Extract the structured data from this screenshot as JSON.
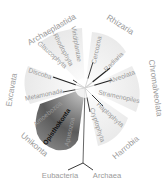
{
  "diagram": {
    "center": [
      85,
      88
    ],
    "supergroups": [
      {
        "id": "archaeplastida",
        "label": "Archaeplastida",
        "x": 52,
        "y": 30,
        "rot": -30
      },
      {
        "id": "rhizaria",
        "label": "Rhizaria",
        "x": 120,
        "y": 25,
        "rot": 32
      },
      {
        "id": "chromalveolata",
        "label": "Chromalveolata",
        "x": 155,
        "y": 88,
        "rot": 82
      },
      {
        "id": "excavata",
        "label": "Excavata",
        "x": 12,
        "y": 90,
        "rot": -80
      },
      {
        "id": "unikonta",
        "label": "Unikonta",
        "x": 34,
        "y": 145,
        "rot": 40
      },
      {
        "id": "harrobia",
        "label": "Harrobia",
        "x": 126,
        "y": 148,
        "rot": -40
      }
    ],
    "groups": [
      {
        "id": "viridiplantae",
        "label": "Viridiplantae",
        "x": 76,
        "y": 44,
        "rot": 80
      },
      {
        "id": "rhodophyta",
        "label": "Rhodophyta",
        "x": 63,
        "y": 50,
        "rot": 62
      },
      {
        "id": "glaucophyta",
        "label": "Glaucophyta",
        "x": 52,
        "y": 55,
        "rot": 42
      },
      {
        "id": "cercozoa",
        "label": "Cercozoa",
        "x": 97,
        "y": 50,
        "rot": -78
      },
      {
        "id": "radiaria",
        "label": "Radiaria",
        "x": 114,
        "y": 62,
        "rot": -45
      },
      {
        "id": "alveolata",
        "label": "Alveolata",
        "x": 122,
        "y": 77,
        "rot": -20
      },
      {
        "id": "stramenopiles",
        "label": "Stramenopiles",
        "x": 119,
        "y": 97,
        "rot": 12
      },
      {
        "id": "haptophyta",
        "label": "Haptophyta",
        "x": 110,
        "y": 115,
        "rot": 42
      },
      {
        "id": "cryptophyta",
        "label": "Cryptophyta",
        "x": 97,
        "y": 125,
        "rot": 72
      },
      {
        "id": "discoba",
        "label": "Discoba",
        "x": 40,
        "y": 74,
        "rot": 18
      },
      {
        "id": "metamonada",
        "label": "Metamonada",
        "x": 44,
        "y": 95,
        "rot": -12
      },
      {
        "id": "amoebozoa",
        "label": "Amoebozoa",
        "x": 48,
        "y": 114,
        "rot": -40
      },
      {
        "id": "opisthokonta",
        "label": "Opisthokonta",
        "x": 57,
        "y": 127,
        "rot": -55,
        "highlight": true
      },
      {
        "id": "apusozoa",
        "label": "Apusozoa",
        "x": 70,
        "y": 132,
        "rot": -78
      }
    ],
    "roots": [
      {
        "id": "eubacteria",
        "label": "Eubacteria",
        "x": 60,
        "y": 176
      },
      {
        "id": "archaea",
        "label": "Archaea",
        "x": 107,
        "y": 176
      }
    ],
    "colors": {
      "label": "#9a9a9a",
      "line": "#222222",
      "wedge_light": "#ececec",
      "wedge_dark": "#4a4a4a",
      "highlight_text": "#111111"
    }
  }
}
